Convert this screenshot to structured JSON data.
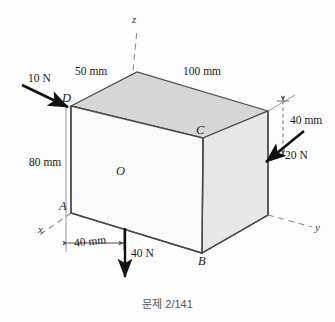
{
  "figure": {
    "caption": "문제 2/141",
    "background_color": "#fdfdfd",
    "line_color": "#4a4a4a",
    "dashed_color": "#8a8a8a",
    "arrow_color": "#111111",
    "faces": {
      "top_color": "#d6d6d6",
      "right_color": "#e6e6e6",
      "front_color": "#fafafa"
    }
  },
  "axes": {
    "z_label": "z",
    "y_label": "y",
    "x_label": "x",
    "origin_label": "O"
  },
  "vertices": {
    "a": "A",
    "b": "B",
    "c": "C",
    "d": "D"
  },
  "dimensions": [
    {
      "name": "top-left-edge",
      "text": "50 mm"
    },
    {
      "name": "top-right-edge",
      "text": "100 mm"
    },
    {
      "name": "right-offset",
      "text": "40 mm"
    },
    {
      "name": "left-height",
      "text": "80 mm"
    },
    {
      "name": "bottom-offset",
      "text": "40 mm"
    }
  ],
  "forces": [
    {
      "name": "force-10n",
      "text": "10 N",
      "direction": "down-right"
    },
    {
      "name": "force-20n",
      "text": "20 N",
      "direction": "down-left"
    },
    {
      "name": "force-40n",
      "text": "40 N",
      "direction": "down"
    }
  ]
}
